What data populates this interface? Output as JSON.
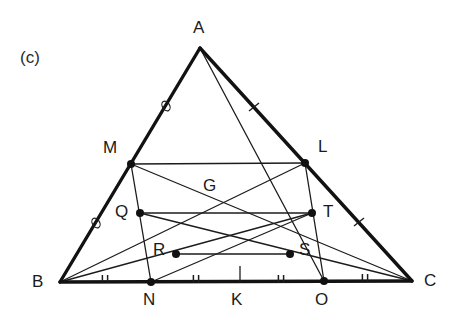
{
  "figure": {
    "caption": "(c)",
    "caption_pos": {
      "x": 20,
      "y": 48
    },
    "stroke_color": "#1c1c1c",
    "thick_stroke_color": "#121212",
    "point_color": "#111111",
    "background": "#ffffff"
  },
  "points": {
    "A": {
      "x": 200,
      "y": 48,
      "label": "A",
      "label_x": 193,
      "label_y": 18,
      "dot": false
    },
    "B": {
      "x": 60,
      "y": 282,
      "label": "B",
      "label_x": 32,
      "label_y": 272,
      "dot": false
    },
    "C": {
      "x": 412,
      "y": 281,
      "label": "C",
      "label_x": 424,
      "label_y": 271,
      "dot": false
    },
    "M": {
      "x": 131,
      "y": 164,
      "label": "M",
      "label_x": 103,
      "label_y": 138,
      "dot": true
    },
    "L": {
      "x": 305,
      "y": 163,
      "label": "L",
      "label_x": 318,
      "label_y": 137,
      "dot": true
    },
    "G": {
      "x": 223,
      "y": 203,
      "label": "G",
      "label_x": 203,
      "label_y": 176,
      "dot": false
    },
    "Q": {
      "x": 140,
      "y": 213,
      "label": "Q",
      "label_x": 115,
      "label_y": 202,
      "dot": true
    },
    "T": {
      "x": 312,
      "y": 213,
      "label": "T",
      "label_x": 323,
      "label_y": 202,
      "dot": true
    },
    "R": {
      "x": 176,
      "y": 254,
      "label": "R",
      "label_x": 153,
      "label_y": 240,
      "dot": true
    },
    "S": {
      "x": 290,
      "y": 254,
      "label": "S",
      "label_x": 299,
      "label_y": 240,
      "dot": true
    },
    "N": {
      "x": 151,
      "y": 282,
      "label": "N",
      "label_x": 143,
      "label_y": 290,
      "dot": true
    },
    "K": {
      "x": 240,
      "y": 282,
      "label": "K",
      "label_x": 231,
      "label_y": 290,
      "dot": false
    },
    "O": {
      "x": 324,
      "y": 281,
      "label": "O",
      "label_x": 315,
      "label_y": 290,
      "dot": true
    }
  },
  "thick_edges": [
    {
      "name": "side-AB",
      "from": "A",
      "to": "B"
    },
    {
      "name": "side-AC",
      "from": "A",
      "to": "C"
    },
    {
      "name": "side-BC",
      "from": "B",
      "to": "C"
    }
  ],
  "thin_edges": [
    {
      "name": "segment-ML",
      "from": "M",
      "to": "L"
    },
    {
      "name": "segment-QT",
      "from": "Q",
      "to": "T"
    },
    {
      "name": "segment-RS",
      "from": "R",
      "to": "S"
    },
    {
      "name": "median-AO",
      "from": "A",
      "to": "O"
    },
    {
      "name": "median-BL",
      "from": "B",
      "to": "L"
    },
    {
      "name": "median-CM",
      "from": "C",
      "to": "M"
    },
    {
      "name": "cevian-MN",
      "from": "M",
      "to": "N"
    },
    {
      "name": "cevian-LO",
      "from": "L",
      "to": "O"
    },
    {
      "name": "cevian-BT",
      "from": "B",
      "to": "T"
    },
    {
      "name": "cevian-NG-ext",
      "from": "N",
      "to": "T"
    },
    {
      "name": "cevian-CQ",
      "from": "C",
      "to": "Q"
    }
  ],
  "tick_marks": {
    "bc_double_ticks": [
      {
        "name": "tick-BN-midpoint",
        "x": 105,
        "y": 282
      },
      {
        "name": "tick-NK-midpoint",
        "x": 196,
        "y": 282
      },
      {
        "name": "tick-KO-midpoint",
        "x": 281,
        "y": 282
      },
      {
        "name": "tick-OC-midpoint",
        "x": 365,
        "y": 281
      }
    ],
    "ab_circle_ticks": [
      {
        "name": "tick-circle-AM",
        "x": 166,
        "y": 106
      },
      {
        "name": "tick-circle-MB",
        "x": 96,
        "y": 223
      }
    ],
    "ac_slash_ticks": [
      {
        "name": "tick-slash-AL",
        "x": 254,
        "y": 107
      },
      {
        "name": "tick-slash-LC",
        "x": 359,
        "y": 222
      }
    ],
    "vertical_tick_K": {
      "name": "tick-K-marker",
      "x": 240,
      "y": 276
    }
  },
  "legend_note": ""
}
